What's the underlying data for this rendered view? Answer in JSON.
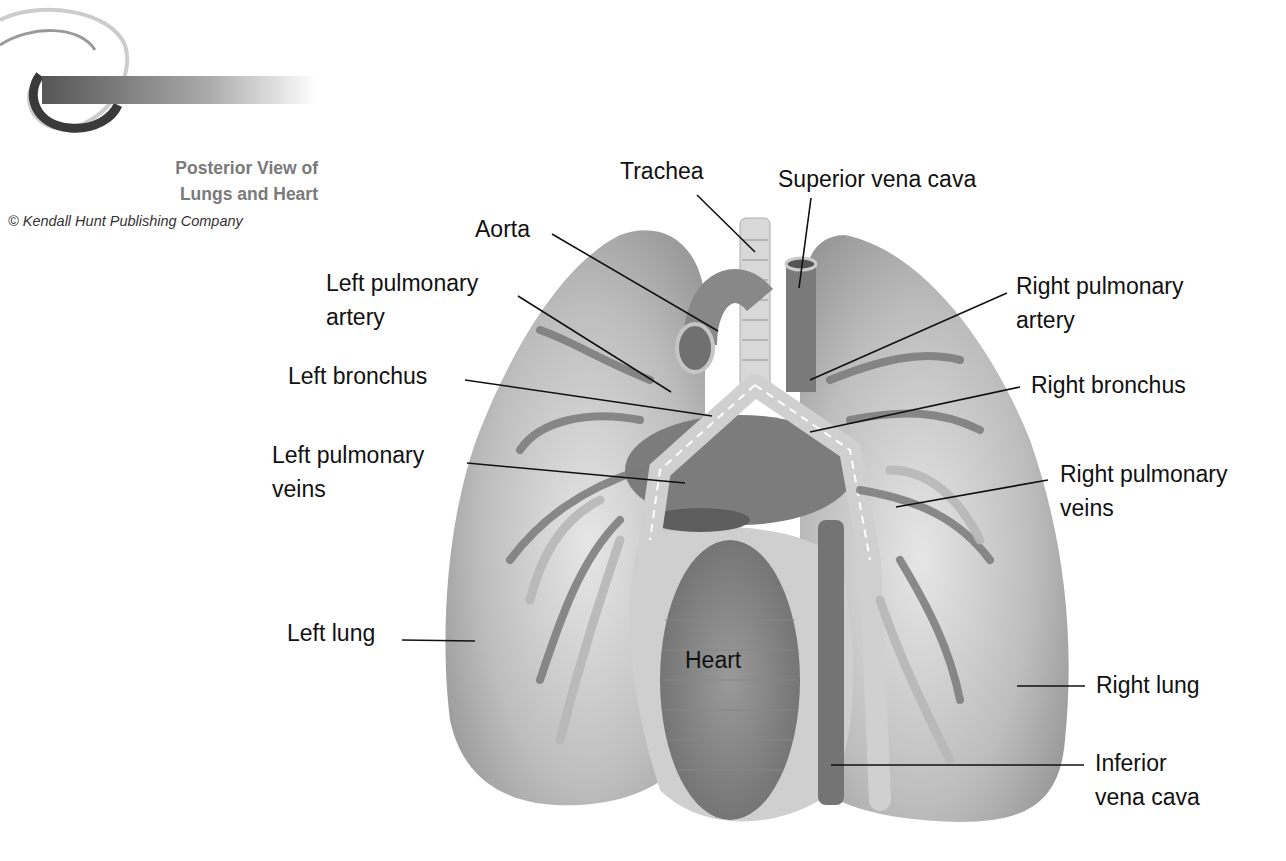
{
  "header": {
    "title_line1": "Posterior View of",
    "title_line2": "Lungs and Heart",
    "copyright": "© Kendall Hunt Publishing Company"
  },
  "diagram": {
    "subject": "Posterior view of lungs and heart",
    "labels": {
      "trachea": "Trachea",
      "superior_vena_cava": "Superior vena cava",
      "aorta": "Aorta",
      "left_pulmonary_artery": [
        "Left pulmonary",
        "artery"
      ],
      "right_pulmonary_artery": [
        "Right pulmonary",
        "artery"
      ],
      "left_bronchus": "Left bronchus",
      "right_bronchus": "Right bronchus",
      "left_pulmonary_veins": [
        "Left pulmonary",
        "veins"
      ],
      "right_pulmonary_veins": [
        "Right pulmonary",
        "veins"
      ],
      "left_lung": "Left lung",
      "heart": "Heart",
      "right_lung": "Right lung",
      "inferior_vena_cava": [
        "Inferior",
        "vena cava"
      ]
    },
    "colors": {
      "lung": "#a9a9a9",
      "vessel": "#6f6f6f",
      "bronchus": "#c9c9c9",
      "title": "#7a7a7a"
    }
  }
}
